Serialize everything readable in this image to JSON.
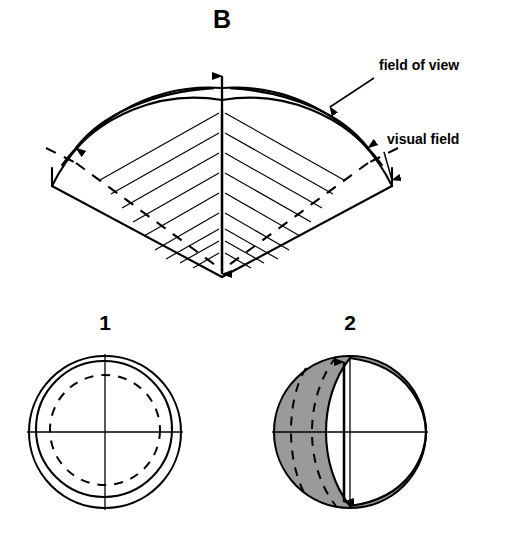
{
  "figure": {
    "panel_label": "B",
    "background_color": "#ffffff",
    "ink_color": "#000000",
    "shade_color": "#9a9a9a"
  },
  "annotations": [
    {
      "id": "field-of-view",
      "text": "field of view",
      "x": 379,
      "y": 70,
      "leader": {
        "x1": 370,
        "y1": 78,
        "x2": 326,
        "y2": 109
      }
    },
    {
      "id": "visual-field",
      "text": "visual field",
      "x": 387,
      "y": 144,
      "leader": {
        "x1": 380,
        "y1": 152,
        "x2": 388,
        "y2": 185
      }
    }
  ],
  "fan_diagram": {
    "apex_x": 222,
    "apex_y": 277,
    "center_axis": {
      "x": 222,
      "y_top": 68,
      "y_bottom": 277
    },
    "outer_arc_label": "field of view boundary",
    "inner_arc_label": "visual field boundary",
    "hatch_line_count": 18,
    "curved_arrow_count": 2
  },
  "circles": [
    {
      "id": "circle-1",
      "number": "1",
      "number_x": 105,
      "number_y": 330,
      "center_x": 105,
      "center_y": 432,
      "outer_radius": 76,
      "inner_radius": 68,
      "dashed_radius": 55,
      "shaded": false,
      "description": "concentric field of view and visual field, fully overlapping"
    },
    {
      "id": "circle-2",
      "number": "2",
      "number_x": 350,
      "number_y": 330,
      "center_x": 350,
      "center_y": 432,
      "outer_radius": 76,
      "inner_radius": 68,
      "dashed_radius": 55,
      "shaded": true,
      "description": "displaced field of view relative to visual field, non-overlap shaded"
    }
  ]
}
